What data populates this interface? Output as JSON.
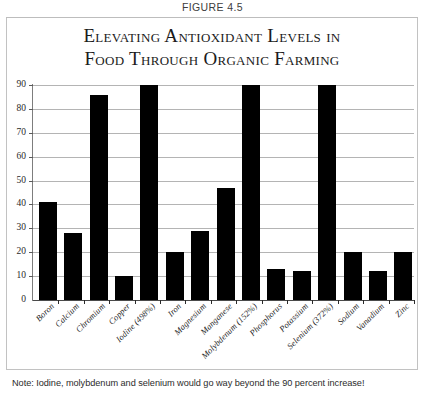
{
  "figure": {
    "caption": "FIGURE 4.5",
    "note": "Note:  Iodine, molybdenum and selenium would go way beyond the 90 percent increase!"
  },
  "title": {
    "line1": "Elevating Antioxidant Levels in",
    "line2": "Food Through Organic Farming"
  },
  "colors": {
    "bar": "#000000",
    "gridline": "#b4b4b4",
    "axis": "#7d7d7d",
    "frame": "#c2c2c2",
    "text": "#1b1b1b"
  },
  "chart_data": {
    "type": "bar",
    "title": "Elevating Antioxidant Levels in Food Through Organic Farming",
    "xlabel": "",
    "ylabel": "",
    "ylim": [
      0,
      90
    ],
    "yticks": [
      0,
      10,
      20,
      30,
      40,
      50,
      60,
      70,
      80,
      90
    ],
    "grid": true,
    "legend": false,
    "annotation": "Note:  Iodine, molybdenum and selenium would go way beyond the 90 percent increase!",
    "categories": [
      "Boron",
      "Calcium",
      "Chromium",
      "Copper",
      "Iodine (498%)",
      "Iron",
      "Magnesium",
      "Manganese",
      "Molybdenum (152%)",
      "Phosphorus",
      "Potassium",
      "Selenium (372%)",
      "Sodium",
      "Vanadium",
      "Zinc"
    ],
    "values": [
      41,
      28,
      86,
      10,
      90,
      20,
      29,
      47,
      90,
      13,
      12,
      90,
      20,
      12,
      20
    ]
  }
}
